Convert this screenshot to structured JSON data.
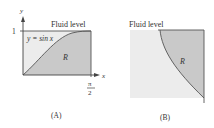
{
  "panels": [
    {
      "id": "A",
      "caption": "(A)",
      "fluid_label": "Fluid level",
      "curve_label": "y = sin x",
      "region_label": "R",
      "y_axis_label": "y",
      "x_axis_label": "x",
      "y_tick": "1",
      "x_tick_num": "π",
      "x_tick_den": "2"
    },
    {
      "id": "B",
      "caption": "(B)",
      "fluid_label": "Fluid level",
      "region_label": "R"
    }
  ],
  "colors": {
    "region_fill": "#c9c9c9",
    "background_fill": "#ececec",
    "line": "#555555"
  }
}
